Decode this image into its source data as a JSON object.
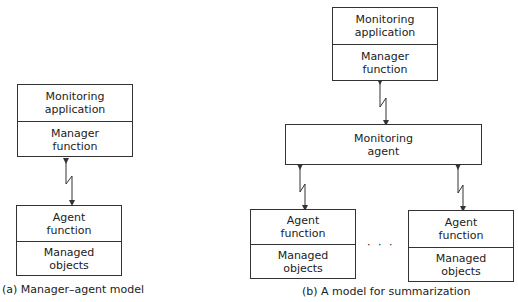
{
  "diagram_a": {
    "caption": "(a) Manager–agent model",
    "manager_stack": {
      "top": "Monitoring\napplication",
      "bottom": "Manager\nfunction"
    },
    "agent_stack": {
      "top": "Agent\nfunction",
      "bottom": "Managed\nobjects"
    }
  },
  "diagram_b": {
    "caption": "(b) A model for summarization",
    "manager_stack": {
      "top": "Monitoring\napplication",
      "bottom": "Manager\nfunction"
    },
    "monitoring_agent": "Monitoring\nagent",
    "agent_stacks": [
      {
        "top": "Agent\nfunction",
        "bottom": "Managed\nobjects"
      },
      {
        "top": "Agent\nfunction",
        "bottom": "Managed\nobjects"
      }
    ],
    "ellipsis": "· · ·"
  },
  "colors": {
    "line": "#333333",
    "text": "#222222",
    "background": "#ffffff"
  }
}
